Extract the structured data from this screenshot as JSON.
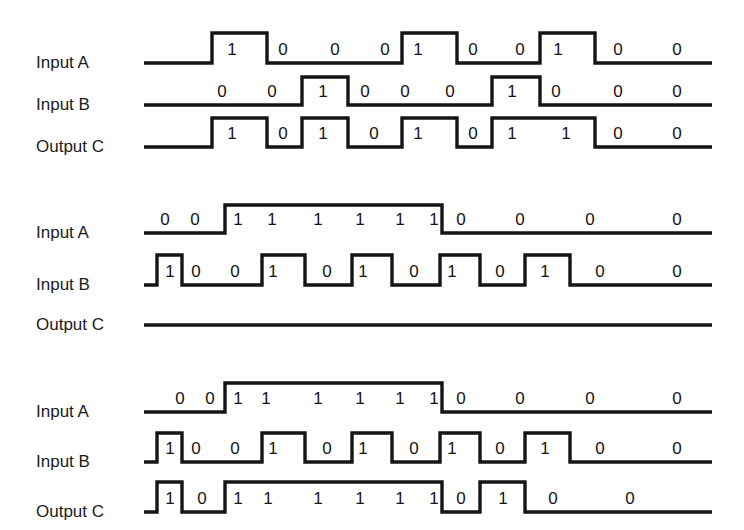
{
  "figure": {
    "width": 744,
    "height": 530,
    "background_color": "#ffffff",
    "line_color": "#151515",
    "text_color": "#1b1b1b"
  },
  "chart_data": {
    "type": "line",
    "xlabel": "",
    "ylabel": "",
    "legend_position": "left",
    "grid": false,
    "diagrams": [
      {
        "id": "diagram-1",
        "label_x": 36,
        "rows": [
          {
            "name": "Input A",
            "baseline_y": 63,
            "high_y": 33,
            "start_x": 144,
            "end_x": 712,
            "transitions": [
              212,
              267,
              402,
              457,
              540,
              595
            ],
            "start_level": 0,
            "bits": [
              {
                "value": "1",
                "x": 232,
                "y": 55
              },
              {
                "value": "0",
                "x": 283,
                "y": 55
              },
              {
                "value": "0",
                "x": 335,
                "y": 55
              },
              {
                "value": "0",
                "x": 385,
                "y": 55
              },
              {
                "value": "1",
                "x": 418,
                "y": 55
              },
              {
                "value": "0",
                "x": 473,
                "y": 55
              },
              {
                "value": "0",
                "x": 520,
                "y": 55
              },
              {
                "value": "1",
                "x": 558,
                "y": 55
              },
              {
                "value": "0",
                "x": 618,
                "y": 55
              },
              {
                "value": "0",
                "x": 677,
                "y": 55
              }
            ]
          },
          {
            "name": "Input B",
            "baseline_y": 105,
            "high_y": 77,
            "start_x": 144,
            "end_x": 712,
            "transitions": [
              302,
              348,
              492,
              540
            ],
            "start_level": 0,
            "bits": [
              {
                "value": "0",
                "x": 222,
                "y": 97
              },
              {
                "value": "0",
                "x": 272,
                "y": 97
              },
              {
                "value": "1",
                "x": 323,
                "y": 97
              },
              {
                "value": "0",
                "x": 365,
                "y": 97
              },
              {
                "value": "0",
                "x": 405,
                "y": 97
              },
              {
                "value": "0",
                "x": 450,
                "y": 97
              },
              {
                "value": "1",
                "x": 512,
                "y": 97
              },
              {
                "value": "0",
                "x": 556,
                "y": 97
              },
              {
                "value": "0",
                "x": 618,
                "y": 97
              },
              {
                "value": "0",
                "x": 677,
                "y": 97
              }
            ]
          },
          {
            "name": "Output C",
            "baseline_y": 147,
            "high_y": 118,
            "start_x": 144,
            "end_x": 712,
            "transitions": [
              212,
              267,
              302,
              348,
              402,
              457,
              492,
              595
            ],
            "start_level": 0,
            "bits": [
              {
                "value": "1",
                "x": 232,
                "y": 139
              },
              {
                "value": "0",
                "x": 283,
                "y": 139
              },
              {
                "value": "1",
                "x": 323,
                "y": 139
              },
              {
                "value": "0",
                "x": 374,
                "y": 139
              },
              {
                "value": "1",
                "x": 418,
                "y": 139
              },
              {
                "value": "0",
                "x": 473,
                "y": 139
              },
              {
                "value": "1",
                "x": 512,
                "y": 139
              },
              {
                "value": "1",
                "x": 566,
                "y": 139
              },
              {
                "value": "0",
                "x": 618,
                "y": 139
              },
              {
                "value": "0",
                "x": 677,
                "y": 139
              }
            ]
          }
        ]
      },
      {
        "id": "diagram-2",
        "label_x": 36,
        "rows": [
          {
            "name": "Input A",
            "baseline_y": 233,
            "high_y": 205,
            "start_x": 144,
            "end_x": 712,
            "transitions": [
              225,
              442
            ],
            "start_level": 0,
            "bits": [
              {
                "value": "0",
                "x": 165,
                "y": 225
              },
              {
                "value": "0",
                "x": 195,
                "y": 225
              },
              {
                "value": "1",
                "x": 238,
                "y": 225
              },
              {
                "value": "1",
                "x": 272,
                "y": 225
              },
              {
                "value": "1",
                "x": 318,
                "y": 225
              },
              {
                "value": "1",
                "x": 360,
                "y": 225
              },
              {
                "value": "1",
                "x": 400,
                "y": 225
              },
              {
                "value": "1",
                "x": 434,
                "y": 225
              },
              {
                "value": "0",
                "x": 461,
                "y": 225
              },
              {
                "value": "0",
                "x": 520,
                "y": 225
              },
              {
                "value": "0",
                "x": 590,
                "y": 225
              },
              {
                "value": "0",
                "x": 677,
                "y": 225
              }
            ]
          },
          {
            "name": "Input B",
            "baseline_y": 285,
            "high_y": 255,
            "start_x": 144,
            "end_x": 712,
            "transitions": [
              157,
              182,
              262,
              305,
              352,
              392,
              440,
              480,
              525,
              570
            ],
            "start_level": 0,
            "bits": [
              {
                "value": "1",
                "x": 170,
                "y": 277
              },
              {
                "value": "0",
                "x": 196,
                "y": 277
              },
              {
                "value": "0",
                "x": 235,
                "y": 277
              },
              {
                "value": "1",
                "x": 273,
                "y": 277
              },
              {
                "value": "0",
                "x": 327,
                "y": 277
              },
              {
                "value": "1",
                "x": 363,
                "y": 277
              },
              {
                "value": "0",
                "x": 414,
                "y": 277
              },
              {
                "value": "1",
                "x": 452,
                "y": 277
              },
              {
                "value": "0",
                "x": 500,
                "y": 277
              },
              {
                "value": "1",
                "x": 545,
                "y": 277
              },
              {
                "value": "0",
                "x": 600,
                "y": 277
              },
              {
                "value": "0",
                "x": 677,
                "y": 277
              }
            ]
          },
          {
            "name": "Output C",
            "baseline_y": 325,
            "high_y": 297,
            "start_x": 144,
            "end_x": 712,
            "transitions": [],
            "start_level": 0,
            "bits": []
          }
        ]
      },
      {
        "id": "diagram-3",
        "label_x": 36,
        "rows": [
          {
            "name": "Input A",
            "baseline_y": 412,
            "high_y": 383,
            "start_x": 144,
            "end_x": 712,
            "transitions": [
              225,
              442
            ],
            "start_level": 0,
            "bits": [
              {
                "value": "0",
                "x": 180,
                "y": 404
              },
              {
                "value": "0",
                "x": 210,
                "y": 404
              },
              {
                "value": "1",
                "x": 238,
                "y": 404
              },
              {
                "value": "1",
                "x": 266,
                "y": 404
              },
              {
                "value": "1",
                "x": 318,
                "y": 404
              },
              {
                "value": "1",
                "x": 360,
                "y": 404
              },
              {
                "value": "1",
                "x": 400,
                "y": 404
              },
              {
                "value": "1",
                "x": 434,
                "y": 404
              },
              {
                "value": "0",
                "x": 461,
                "y": 404
              },
              {
                "value": "0",
                "x": 520,
                "y": 404
              },
              {
                "value": "0",
                "x": 590,
                "y": 404
              },
              {
                "value": "0",
                "x": 677,
                "y": 404
              }
            ]
          },
          {
            "name": "Input B",
            "baseline_y": 462,
            "high_y": 433,
            "start_x": 144,
            "end_x": 712,
            "transitions": [
              157,
              182,
              262,
              305,
              352,
              392,
              440,
              480,
              525,
              570
            ],
            "start_level": 0,
            "bits": [
              {
                "value": "1",
                "x": 170,
                "y": 454
              },
              {
                "value": "0",
                "x": 196,
                "y": 454
              },
              {
                "value": "0",
                "x": 235,
                "y": 454
              },
              {
                "value": "1",
                "x": 273,
                "y": 454
              },
              {
                "value": "0",
                "x": 327,
                "y": 454
              },
              {
                "value": "1",
                "x": 363,
                "y": 454
              },
              {
                "value": "0",
                "x": 414,
                "y": 454
              },
              {
                "value": "1",
                "x": 452,
                "y": 454
              },
              {
                "value": "0",
                "x": 500,
                "y": 454
              },
              {
                "value": "1",
                "x": 545,
                "y": 454
              },
              {
                "value": "0",
                "x": 600,
                "y": 454
              },
              {
                "value": "0",
                "x": 677,
                "y": 454
              }
            ]
          },
          {
            "name": "Output C",
            "baseline_y": 512,
            "high_y": 482,
            "start_x": 144,
            "end_x": 712,
            "transitions": [
              157,
              182,
              225,
              442,
              480,
              525
            ],
            "start_level": 0,
            "bits": [
              {
                "value": "1",
                "x": 170,
                "y": 504
              },
              {
                "value": "0",
                "x": 202,
                "y": 504
              },
              {
                "value": "1",
                "x": 238,
                "y": 504
              },
              {
                "value": "1",
                "x": 268,
                "y": 504
              },
              {
                "value": "1",
                "x": 318,
                "y": 504
              },
              {
                "value": "1",
                "x": 360,
                "y": 504
              },
              {
                "value": "1",
                "x": 400,
                "y": 504
              },
              {
                "value": "1",
                "x": 434,
                "y": 504
              },
              {
                "value": "0",
                "x": 461,
                "y": 504
              },
              {
                "value": "1",
                "x": 503,
                "y": 504
              },
              {
                "value": "0",
                "x": 553,
                "y": 504
              },
              {
                "value": "0",
                "x": 630,
                "y": 504
              }
            ]
          }
        ]
      }
    ]
  }
}
